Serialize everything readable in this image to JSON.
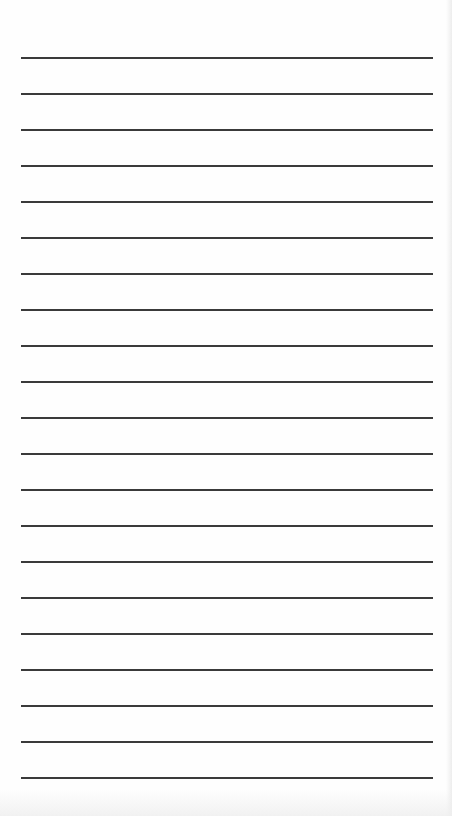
{
  "sheet": {
    "type": "lined-paper",
    "line_count": 21,
    "first_line_y": 58,
    "line_spacing": 36,
    "line_left": 21,
    "line_width": 412,
    "line_color": "#3a3a3a",
    "background_color": "#fefefe"
  }
}
